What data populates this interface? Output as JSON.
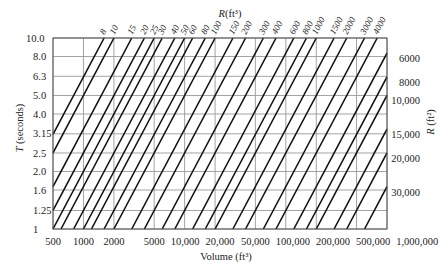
{
  "figure": {
    "top_axis": {
      "symbol": "R",
      "unit": "(ft³)"
    },
    "left_axis": {
      "symbol": "T",
      "unit": " (seconds)"
    },
    "right_axis": {
      "symbol": "R",
      "unit": " (ft²)"
    },
    "bottom_axis": {
      "title": "Volume (ft³)"
    }
  },
  "chart_data": {
    "type": "line",
    "title": "",
    "xlabel": "Volume (ft³)",
    "ylabel": "T (seconds)",
    "secondary_labels": {
      "top": "R (ft³)",
      "right": "R (ft²)"
    },
    "x_scale": "log",
    "xlim": [
      500,
      1000000
    ],
    "y_scale": "log",
    "ylim": [
      1,
      10
    ],
    "grid": true,
    "legend": "none",
    "relation": "T = 0.05 · V / R (family of constant-R lines)",
    "x_ticks": [
      {
        "value": 500,
        "label": "500"
      },
      {
        "value": 1000,
        "label": "1000"
      },
      {
        "value": 2000,
        "label": "2000"
      },
      {
        "value": 5000,
        "label": "5000"
      },
      {
        "value": 10000,
        "label": "10,000"
      },
      {
        "value": 20000,
        "label": "20,000"
      },
      {
        "value": 50000,
        "label": "50,000"
      },
      {
        "value": 100000,
        "label": "100,000"
      },
      {
        "value": 200000,
        "label": "200,000"
      },
      {
        "value": 500000,
        "label": "500,000"
      },
      {
        "value": 1000000,
        "label": "1,000,000"
      }
    ],
    "y_ticks": [
      {
        "value": 10,
        "label": "10.0"
      },
      {
        "value": 8,
        "label": "8.0"
      },
      {
        "value": 6.3,
        "label": "6.3"
      },
      {
        "value": 5,
        "label": "5.0"
      },
      {
        "value": 4,
        "label": "4.0"
      },
      {
        "value": 3.15,
        "label": "3.15"
      },
      {
        "value": 2.5,
        "label": "2.5"
      },
      {
        "value": 2,
        "label": "2.0"
      },
      {
        "value": 1.6,
        "label": "1.6"
      },
      {
        "value": 1.25,
        "label": "1.25"
      },
      {
        "value": 1,
        "label": "1"
      }
    ],
    "series": [
      {
        "name": "8",
        "R": 8,
        "label_side": "top",
        "points": [
          [
            500,
            3.125
          ],
          [
            1600,
            10
          ]
        ]
      },
      {
        "name": "10",
        "R": 10,
        "label_side": "top",
        "points": [
          [
            500,
            2.5
          ],
          [
            2000,
            10
          ]
        ]
      },
      {
        "name": "15",
        "R": 15,
        "label_side": "top",
        "points": [
          [
            500,
            1.667
          ],
          [
            3000,
            10
          ]
        ]
      },
      {
        "name": "20",
        "R": 20,
        "label_side": "top",
        "points": [
          [
            500,
            1.25
          ],
          [
            4000,
            10
          ]
        ]
      },
      {
        "name": "25",
        "R": 25,
        "label_side": "top",
        "points": [
          [
            500,
            1
          ],
          [
            5000,
            10
          ]
        ]
      },
      {
        "name": "30",
        "R": 30,
        "label_side": "top",
        "points": [
          [
            600,
            1
          ],
          [
            6000,
            10
          ]
        ]
      },
      {
        "name": "40",
        "R": 40,
        "label_side": "top",
        "points": [
          [
            800,
            1
          ],
          [
            8000,
            10
          ]
        ]
      },
      {
        "name": "50",
        "R": 50,
        "label_side": "top",
        "points": [
          [
            1000,
            1
          ],
          [
            10000,
            10
          ]
        ]
      },
      {
        "name": "60",
        "R": 60,
        "label_side": "top",
        "points": [
          [
            1200,
            1
          ],
          [
            12000,
            10
          ]
        ]
      },
      {
        "name": "80",
        "R": 80,
        "label_side": "top",
        "points": [
          [
            1600,
            1
          ],
          [
            16000,
            10
          ]
        ]
      },
      {
        "name": "100",
        "R": 100,
        "label_side": "top",
        "points": [
          [
            2000,
            1
          ],
          [
            20000,
            10
          ]
        ]
      },
      {
        "name": "150",
        "R": 150,
        "label_side": "top",
        "points": [
          [
            3000,
            1
          ],
          [
            30000,
            10
          ]
        ]
      },
      {
        "name": "200",
        "R": 200,
        "label_side": "top",
        "points": [
          [
            4000,
            1
          ],
          [
            40000,
            10
          ]
        ]
      },
      {
        "name": "300",
        "R": 300,
        "label_side": "top",
        "points": [
          [
            6000,
            1
          ],
          [
            60000,
            10
          ]
        ]
      },
      {
        "name": "400",
        "R": 400,
        "label_side": "top",
        "points": [
          [
            8000,
            1
          ],
          [
            80000,
            10
          ]
        ]
      },
      {
        "name": "600",
        "R": 600,
        "label_side": "top",
        "points": [
          [
            12000,
            1
          ],
          [
            120000,
            10
          ]
        ]
      },
      {
        "name": "800",
        "R": 800,
        "label_side": "top",
        "points": [
          [
            16000,
            1
          ],
          [
            160000,
            10
          ]
        ]
      },
      {
        "name": "1000",
        "R": 1000,
        "label_side": "top",
        "points": [
          [
            20000,
            1
          ],
          [
            200000,
            10
          ]
        ]
      },
      {
        "name": "1500",
        "R": 1500,
        "label_side": "top",
        "points": [
          [
            30000,
            1
          ],
          [
            300000,
            10
          ]
        ]
      },
      {
        "name": "2000",
        "R": 2000,
        "label_side": "top",
        "points": [
          [
            40000,
            1
          ],
          [
            400000,
            10
          ]
        ]
      },
      {
        "name": "3000",
        "R": 3000,
        "label_side": "top",
        "points": [
          [
            60000,
            1
          ],
          [
            600000,
            10
          ]
        ]
      },
      {
        "name": "4000",
        "R": 4000,
        "label_side": "top",
        "points": [
          [
            80000,
            1
          ],
          [
            800000,
            10
          ]
        ]
      },
      {
        "name": "6000",
        "R": 6000,
        "label_side": "right",
        "points": [
          [
            120000,
            1
          ],
          [
            1000000,
            8.333
          ]
        ]
      },
      {
        "name": "8000",
        "R": 8000,
        "label_side": "right",
        "points": [
          [
            160000,
            1
          ],
          [
            1000000,
            6.25
          ]
        ]
      },
      {
        "name": "10,000",
        "R": 10000,
        "label_side": "right",
        "points": [
          [
            200000,
            1
          ],
          [
            1000000,
            5
          ]
        ]
      },
      {
        "name": "15,000",
        "R": 15000,
        "label_side": "right",
        "points": [
          [
            300000,
            1
          ],
          [
            1000000,
            3.333
          ]
        ]
      },
      {
        "name": "20,000",
        "R": 20000,
        "label_side": "right",
        "points": [
          [
            400000,
            1
          ],
          [
            1000000,
            2.5
          ]
        ]
      },
      {
        "name": "30,000",
        "R": 30000,
        "label_side": "right",
        "points": [
          [
            600000,
            1
          ],
          [
            1000000,
            1.667
          ]
        ]
      }
    ]
  }
}
